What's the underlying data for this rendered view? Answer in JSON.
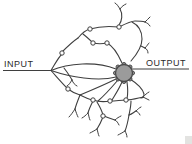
{
  "diagram": {
    "input_label": "INPUT",
    "output_label": "OUTPUT",
    "colors": {
      "background": "#ffffff",
      "line": "#3f3f3f",
      "label": "#2b2b2b",
      "soma_fill": "#9b9b9b",
      "soma_stroke": "#4a4a4a",
      "bouton_fill": "#ffffff",
      "corner_artifact": "#e3e3e1"
    },
    "soma": {
      "cx": 124,
      "cy": 73,
      "r": 8.5
    },
    "soma_bumps": [
      {
        "x": 132.5,
        "y": 73
      },
      {
        "x": 130,
        "y": 79
      },
      {
        "x": 124,
        "y": 81.5
      },
      {
        "x": 118,
        "y": 79
      },
      {
        "x": 115.5,
        "y": 73
      },
      {
        "x": 118,
        "y": 67
      },
      {
        "x": 124,
        "y": 64.5
      },
      {
        "x": 130,
        "y": 67
      }
    ],
    "bump_radius": 2,
    "axon_lines": [
      {
        "name": "input-axon",
        "d": "M3,70.5 L51,70.5"
      },
      {
        "name": "output-axon",
        "d": "M132,69 L189,69"
      }
    ],
    "dendrite_paths": [
      "M51,70.5 C68,63 96,61 116,69",
      "M51,70.5 C70,77 98,82 116,77",
      "M51,70.5 C55,64 58,58 62,54",
      "M62,52 C67,47 72,42 78,38",
      "M78,38 C82,33 86,30 90,29",
      "M90,29 C100,26 109,26 119,27",
      "M119,27 C127,23 131,21 135,21 C139,21 142,21 145,22",
      "M120,9 C123,14 122,21 119,25",
      "M83,34 C87,37 90,40 93,43",
      "M93,43 C98,44 102,44 107,43",
      "M107,43 C113,46 118,54 122,63",
      "M131,61 C138,53 142,46 142,39 C142,31 138,25 132,22",
      "M141,46 L145,48",
      "M64,68 C67,72 70,76 72,80",
      "M51,70.5 C56,76 62,83 67,88",
      "M68,89 C72,92 76,94 80,95",
      "M80,95 C84,97 88,99 92,100",
      "M80,95 C78,100 76,105 75,109",
      "M80,95 C92,90 106,84 116,79",
      "M93,101 C91,105 89,109 88,113",
      "M93,100 C99,102 104,102 110,101",
      "M110,101 C116,101 121,100 126,100",
      "M126,100 C132,100 138,98 143,97",
      "M118,80 C112,87 105,95 98,101",
      "M122,82 C119,89 115,95 112,100",
      "M127,82 C128,89 128,94 127,99",
      "M130,79 C138,84 143,90 144,94 C144,97 143,98 141,98",
      "M97,102 C100,107 102,111 103,115",
      "M104,116 C108,118 112,119 115,120",
      "M103,117 C101,122 99,126 97,129",
      "M131,101 C131,106 130,110 129,115",
      "M129,115 C132,114 134,112 136,111",
      "M129,115 C128,121 127,126 125,131"
    ],
    "terminal_forks": [
      "M120,9 C118,6 117,4 115,3 M120,9 C122,6 124,5 126,4",
      "M145,22 C147,20 148,19 150,17 M145,22 C147,23 149,24 150,26",
      "M145,48 C147,46 148,44 149,43 M145,48 C147,49 148,51 148,53",
      "M72,80 C70,83 69,85 67,86 M72,80 C73,83 75,85 77,86",
      "M143,97 C145,95 147,93 149,92 M143,97 C145,98 147,99 149,100",
      "M88,113 C86,115 84,117 82,118 M88,113 C89,116 89,118 90,120",
      "M75,109 C73,112 71,115 69,117 M75,109 C76,112 77,115 78,117",
      "M115,120 C117,118 119,117 121,116 M115,120 C117,121 118,123 119,125",
      "M97,129 C94,131 92,132 90,133 M97,129 C98,132 98,134 99,136",
      "M136,111 C138,109 139,108 141,107 M136,111 C138,112 139,113 140,115",
      "M125,131 C122,133 120,134 118,135 M125,131 C126,133 127,135 127,137"
    ],
    "boutons": [
      {
        "x": 62,
        "y": 53
      },
      {
        "x": 90,
        "y": 29
      },
      {
        "x": 119,
        "y": 27
      },
      {
        "x": 93,
        "y": 43
      },
      {
        "x": 107,
        "y": 43
      },
      {
        "x": 68,
        "y": 89
      },
      {
        "x": 93,
        "y": 100
      },
      {
        "x": 110,
        "y": 101
      },
      {
        "x": 126,
        "y": 100
      },
      {
        "x": 103,
        "y": 116
      }
    ],
    "bouton_radius": 2.2
  }
}
